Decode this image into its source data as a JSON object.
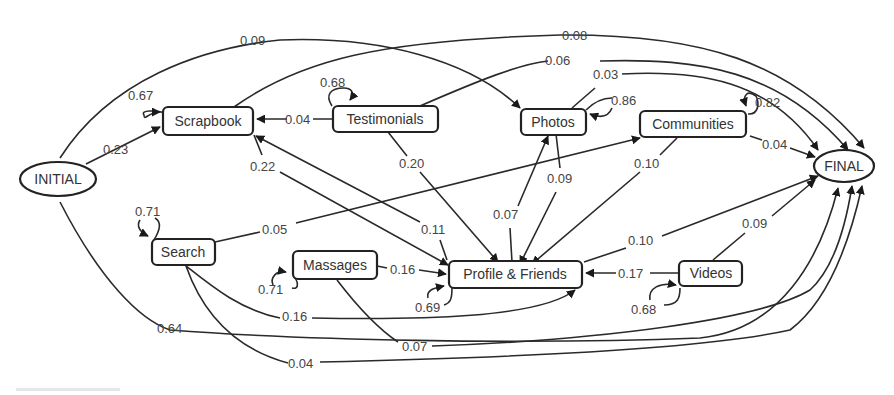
{
  "diagram": {
    "colors": {
      "stroke": "#222222",
      "text": "#333333",
      "background": "#ffffff"
    },
    "nodes": [
      {
        "id": "initial",
        "label": "INITIAL",
        "shape": "ellipse",
        "x": 58,
        "y": 179
      },
      {
        "id": "scrapbook",
        "label": "Scrapbook",
        "shape": "rect",
        "x": 208,
        "y": 121
      },
      {
        "id": "testimonials",
        "label": "Testimonials",
        "shape": "rect",
        "x": 385,
        "y": 119
      },
      {
        "id": "photos",
        "label": "Photos",
        "shape": "rect",
        "x": 553,
        "y": 121
      },
      {
        "id": "communities",
        "label": "Communities",
        "shape": "rect",
        "x": 692,
        "y": 124
      },
      {
        "id": "final",
        "label": "FINAL",
        "shape": "ellipse",
        "x": 844,
        "y": 166
      },
      {
        "id": "search",
        "label": "Search",
        "shape": "rect",
        "x": 183,
        "y": 252
      },
      {
        "id": "massages",
        "label": "Massages",
        "shape": "rect",
        "x": 335,
        "y": 265
      },
      {
        "id": "profile",
        "label": "Profile & Friends",
        "shape": "rect",
        "x": 515,
        "y": 274
      },
      {
        "id": "videos",
        "label": "Videos",
        "shape": "rect",
        "x": 711,
        "y": 273
      }
    ],
    "edges": [
      {
        "from": "initial",
        "to": "scrapbook",
        "weight": "0.23"
      },
      {
        "from": "initial",
        "to": "photos",
        "weight": "0.09"
      },
      {
        "from": "initial",
        "to": "final",
        "weight": "0.64"
      },
      {
        "from": "scrapbook",
        "to": "scrapbook",
        "weight": "0.67"
      },
      {
        "from": "scrapbook",
        "to": "profile",
        "weight": "0.22"
      },
      {
        "from": "scrapbook",
        "to": "final",
        "weight": "0.08"
      },
      {
        "from": "testimonials",
        "to": "testimonials",
        "weight": "0.68"
      },
      {
        "from": "testimonials",
        "to": "scrapbook",
        "weight": "0.04"
      },
      {
        "from": "testimonials",
        "to": "profile",
        "weight": "0.20"
      },
      {
        "from": "testimonials",
        "to": "final",
        "weight": "0.06"
      },
      {
        "from": "photos",
        "to": "photos",
        "weight": "0.86"
      },
      {
        "from": "photos",
        "to": "profile",
        "weight": "0.09"
      },
      {
        "from": "photos",
        "to": "final",
        "weight": "0.03"
      },
      {
        "from": "communities",
        "to": "communities",
        "weight": "0.82"
      },
      {
        "from": "communities",
        "to": "profile",
        "weight": "0.10"
      },
      {
        "from": "communities",
        "to": "final",
        "weight": "0.04"
      },
      {
        "from": "search",
        "to": "search",
        "weight": "0.71"
      },
      {
        "from": "search",
        "to": "communities",
        "weight": "0.05"
      },
      {
        "from": "search",
        "to": "profile",
        "weight": "0.16"
      },
      {
        "from": "search",
        "to": "final",
        "weight": "0.04"
      },
      {
        "from": "massages",
        "to": "massages",
        "weight": "0.71"
      },
      {
        "from": "massages",
        "to": "profile",
        "weight": "0.16"
      },
      {
        "from": "massages",
        "to": "final",
        "weight": "0.07"
      },
      {
        "from": "profile",
        "to": "profile",
        "weight": "0.69"
      },
      {
        "from": "profile",
        "to": "scrapbook",
        "weight": "0.11"
      },
      {
        "from": "profile",
        "to": "photos",
        "weight": "0.07"
      },
      {
        "from": "profile",
        "to": "final",
        "weight": "0.10"
      },
      {
        "from": "videos",
        "to": "videos",
        "weight": "0.68"
      },
      {
        "from": "videos",
        "to": "profile",
        "weight": "0.17"
      },
      {
        "from": "videos",
        "to": "final",
        "weight": "0.09"
      }
    ]
  }
}
